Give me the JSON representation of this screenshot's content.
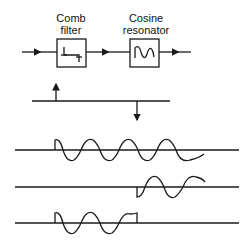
{
  "blocks": [
    {
      "label_line1": "Comb",
      "label_line2": "filter",
      "glyph": "comb-impulse-icon"
    },
    {
      "label_line1": "Cosine",
      "label_line2": "resonator",
      "glyph": "cosine-wave-icon"
    }
  ],
  "colors": {
    "ink": "#1a1a1a",
    "background": "#ffffff"
  }
}
